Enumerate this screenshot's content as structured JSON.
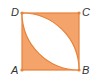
{
  "diagram": {
    "type": "geometry",
    "colors": {
      "fill": "#F4A46A",
      "stroke": "#E8833A",
      "lens": "#FFFFFF",
      "label": "#333333",
      "vertex": "#E8833A"
    },
    "vertices": [
      {
        "name": "A",
        "label": "A",
        "x": 22,
        "y": 70
      },
      {
        "name": "B",
        "label": "B",
        "x": 79,
        "y": 70
      },
      {
        "name": "C",
        "label": "C",
        "x": 79,
        "y": 13
      },
      {
        "name": "D",
        "label": "D",
        "x": 22,
        "y": 13
      }
    ],
    "labels": {
      "A": "A",
      "B": "B",
      "C": "C",
      "D": "D"
    }
  }
}
